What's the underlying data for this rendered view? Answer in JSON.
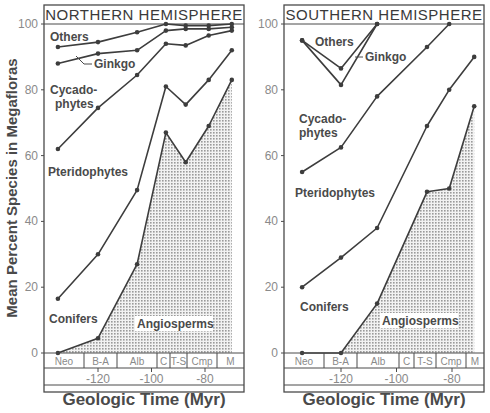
{
  "chart_data": [
    {
      "type": "area",
      "title": "NORTHERN HEMISPHERE",
      "xlabel": "Geologic Time (Myr)",
      "ylabel": "Mean Percent Species in Megafloras",
      "ylim": [
        0,
        100
      ],
      "xlim": [
        -140,
        -66
      ],
      "yticks": [
        "0",
        "20",
        "40",
        "60",
        "80",
        "100"
      ],
      "xticks": [
        "-120",
        "-100",
        "-80"
      ],
      "xtick_values": [
        -120,
        -100,
        -80
      ],
      "stages": [
        "Neo",
        "B-A",
        "Alb",
        "C",
        "T-S",
        "Cmp",
        "M"
      ],
      "x": [
        -135,
        -120,
        -105.4,
        -94.6,
        -87.2,
        -78.6,
        -70
      ],
      "series": [
        {
          "name": "Angiosperms",
          "values": [
            0,
            4.5,
            27,
            67,
            58,
            69,
            83
          ]
        },
        {
          "name": "Conifers",
          "values": [
            16.5,
            30,
            49.5,
            81,
            75.5,
            83,
            92
          ]
        },
        {
          "name": "Pteridophytes",
          "values": [
            62,
            74.5,
            84.5,
            94,
            93.5,
            96.5,
            98
          ]
        },
        {
          "name": "Cycadophytes",
          "values": [
            88,
            91,
            92,
            98,
            98.5,
            98.5,
            99
          ]
        },
        {
          "name": "Ginkgo",
          "values": [
            93,
            94.5,
            97.5,
            100,
            99.5,
            99.5,
            100
          ]
        },
        {
          "name": "Others",
          "values": [
            100,
            100,
            100,
            100,
            100,
            100,
            100
          ]
        }
      ],
      "note": "Curves are cumulative upper boundaries; Angiosperms band is shaded"
    },
    {
      "type": "area",
      "title": "SOUTHERN HEMISPHERE",
      "xlabel": "Geologic Time (Myr)",
      "ylabel": "",
      "ylim": [
        0,
        100
      ],
      "xlim": [
        -140,
        -66
      ],
      "yticks": [
        "0",
        "20",
        "40",
        "60",
        "80",
        "100"
      ],
      "xticks": [
        "-120",
        "-100",
        "-80"
      ],
      "xtick_values": [
        -120,
        -100,
        -80
      ],
      "stages": [
        "Neo",
        "B-A",
        "Alb",
        "C",
        "T-S",
        "Cmp",
        "M"
      ],
      "x": [
        -134,
        -120,
        -107,
        -89,
        -81,
        -72
      ],
      "series": [
        {
          "name": "Angiosperms",
          "values": [
            0,
            0,
            15,
            49,
            50,
            75
          ]
        },
        {
          "name": "Conifers",
          "values": [
            20,
            29,
            38,
            69,
            80,
            90
          ]
        },
        {
          "name": "Pteridophytes",
          "values": [
            55,
            62.5,
            78,
            93,
            100,
            null
          ]
        },
        {
          "name": "Cycadophytes",
          "values": [
            95,
            81.5,
            100,
            null,
            null,
            null
          ]
        },
        {
          "name": "Ginkgo",
          "values": [
            95,
            86.5,
            100,
            null,
            null,
            null
          ]
        },
        {
          "name": "Others",
          "values": [
            100,
            100,
            100,
            100,
            100,
            100
          ]
        }
      ],
      "note": "Curves are cumulative upper boundaries; Angiosperms band is shaded"
    }
  ],
  "labels": {
    "north": {
      "others": "Others",
      "ginkgo": "Ginkgo",
      "cycado1": "Cycado-",
      "cycado2": "phytes",
      "pterido": "Pteridophytes",
      "conifers": "Conifers",
      "angio": "Angiosperms"
    },
    "south": {
      "others": "Others",
      "ginkgo": "Ginkgo",
      "cycado1": "Cycado-",
      "cycado2": "phytes",
      "pterido": "Pteridophytes",
      "conifers": "Conifers",
      "angio": "Angiosperms"
    }
  }
}
